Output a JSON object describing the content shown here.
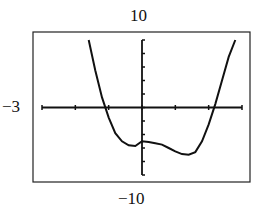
{
  "chart_data": {
    "type": "line",
    "title": "",
    "xlabel": "",
    "ylabel": "",
    "window": {
      "xmin": -3,
      "xmax": 3,
      "xscl": 1,
      "ymin": -10,
      "ymax": 10,
      "yscl": 2
    },
    "labels": {
      "ymax": "10",
      "ymin": "−10",
      "xmin": "−3"
    },
    "grid": false,
    "series": [
      {
        "name": "f(x)",
        "x": [
          -1.6,
          -1.4,
          -1.2,
          -1.0,
          -0.8,
          -0.6,
          -0.4,
          -0.2,
          0.0,
          0.2,
          0.4,
          0.6,
          0.8,
          1.0,
          1.2,
          1.4,
          1.6,
          1.8,
          2.0,
          2.2,
          2.4,
          2.6,
          2.8
        ],
        "y": [
          10,
          5.5,
          1.5,
          -1.5,
          -3.8,
          -5.0,
          -5.6,
          -5.7,
          -5.0,
          -5.1,
          -5.3,
          -5.5,
          -6.0,
          -6.5,
          -6.9,
          -7.0,
          -6.6,
          -5.0,
          -2.5,
          0.5,
          4.0,
          7.5,
          10
        ]
      }
    ]
  }
}
